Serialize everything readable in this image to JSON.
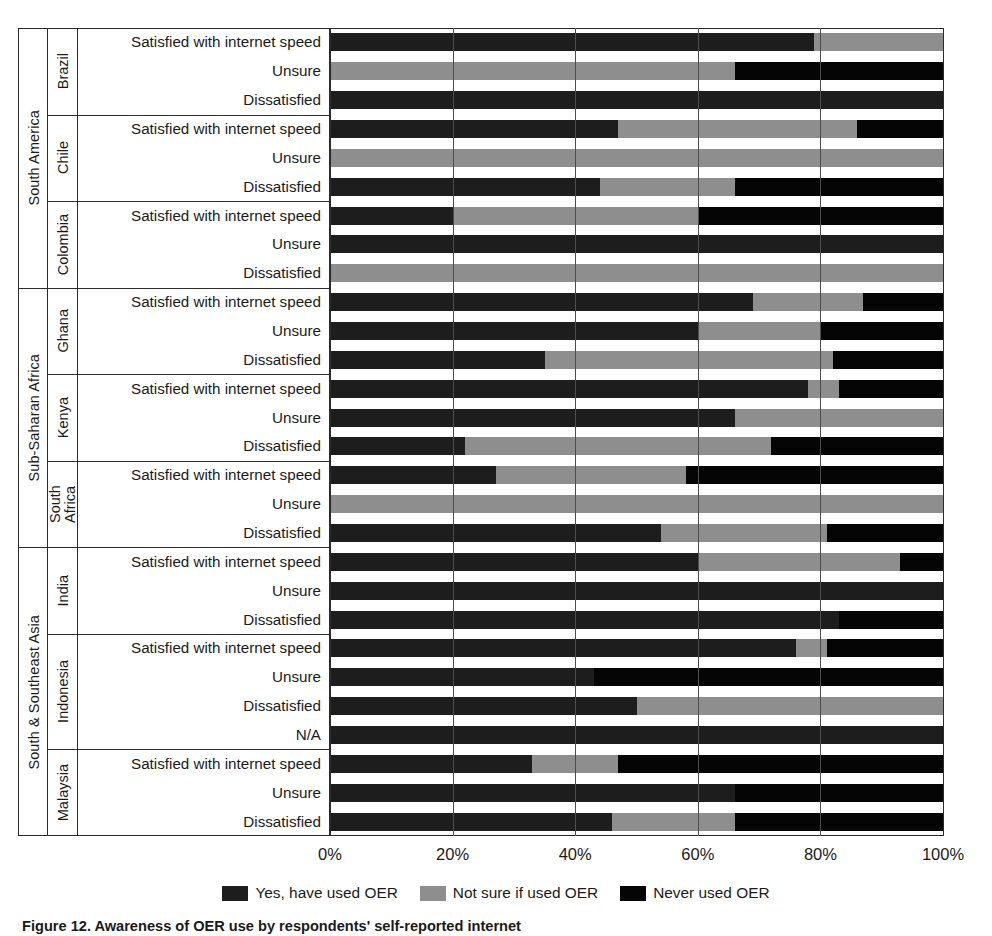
{
  "chart_data": {
    "type": "bar",
    "orientation": "horizontal",
    "stacked": true,
    "normalized": "percent",
    "title": "",
    "xlabel": "",
    "ylabel": "",
    "xlim": [
      0,
      100
    ],
    "xticks": [
      0,
      20,
      40,
      60,
      80,
      100
    ],
    "xtick_labels": [
      "0%",
      "20%",
      "40%",
      "60%",
      "80%",
      "100%"
    ],
    "grid": true,
    "legend_position": "bottom",
    "series": [
      {
        "name": "Yes, have used OER",
        "color": "#1d1d1d"
      },
      {
        "name": "Not sure if used OER",
        "color": "#8e8e8e"
      },
      {
        "name": "Never used OER",
        "color": "#050505"
      }
    ],
    "regions": [
      {
        "label": "South America",
        "countries": [
          {
            "label": "Brazil",
            "rows": [
              {
                "label": "Satisfied with internet speed",
                "values": [
                  79,
                  21,
                  0
                ]
              },
              {
                "label": "Unsure",
                "values": [
                  0,
                  66,
                  34
                ]
              },
              {
                "label": "Dissatisfied",
                "values": [
                  100,
                  0,
                  0
                ]
              }
            ]
          },
          {
            "label": "Chile",
            "rows": [
              {
                "label": "Satisfied with internet speed",
                "values": [
                  47,
                  39,
                  14
                ]
              },
              {
                "label": "Unsure",
                "values": [
                  0,
                  100,
                  0
                ]
              },
              {
                "label": "Dissatisfied",
                "values": [
                  44,
                  22,
                  34
                ]
              }
            ]
          },
          {
            "label": "Colombia",
            "rows": [
              {
                "label": "Satisfied with internet speed",
                "values": [
                  20,
                  40,
                  40
                ]
              },
              {
                "label": "Unsure",
                "values": [
                  100,
                  0,
                  0
                ]
              },
              {
                "label": "Dissatisfied",
                "values": [
                  0,
                  100,
                  0
                ]
              }
            ]
          }
        ]
      },
      {
        "label": "Sub-Saharan Africa",
        "countries": [
          {
            "label": "Ghana",
            "rows": [
              {
                "label": "Satisfied with internet speed",
                "values": [
                  69,
                  18,
                  13
                ]
              },
              {
                "label": "Unsure",
                "values": [
                  60,
                  20,
                  20
                ]
              },
              {
                "label": "Dissatisfied",
                "values": [
                  35,
                  47,
                  18
                ]
              }
            ]
          },
          {
            "label": "Kenya",
            "rows": [
              {
                "label": "Satisfied with internet speed",
                "values": [
                  78,
                  5,
                  17
                ]
              },
              {
                "label": "Unsure",
                "values": [
                  66,
                  34,
                  0
                ]
              },
              {
                "label": "Dissatisfied",
                "values": [
                  22,
                  50,
                  28
                ]
              }
            ]
          },
          {
            "label": "South Africa",
            "label_wrap": true,
            "rows": [
              {
                "label": "Satisfied with internet speed",
                "values": [
                  27,
                  31,
                  42
                ]
              },
              {
                "label": "Unsure",
                "values": [
                  0,
                  100,
                  0
                ]
              },
              {
                "label": "Dissatisfied",
                "values": [
                  54,
                  27,
                  19
                ]
              }
            ]
          }
        ]
      },
      {
        "label": "South & Southeast Asia",
        "countries": [
          {
            "label": "India",
            "rows": [
              {
                "label": "Satisfied with internet speed",
                "values": [
                  60,
                  33,
                  7
                ]
              },
              {
                "label": "Unsure",
                "values": [
                  100,
                  0,
                  0
                ]
              },
              {
                "label": "Dissatisfied",
                "values": [
                  83,
                  0,
                  17
                ]
              }
            ]
          },
          {
            "label": "Indonesia",
            "rows": [
              {
                "label": "Satisfied with internet speed",
                "values": [
                  76,
                  5,
                  19
                ]
              },
              {
                "label": "Unsure",
                "values": [
                  43,
                  0,
                  57
                ]
              },
              {
                "label": "Dissatisfied",
                "values": [
                  50,
                  50,
                  0
                ]
              },
              {
                "label": "N/A",
                "values": [
                  100,
                  0,
                  0
                ]
              }
            ]
          },
          {
            "label": "Malaysia",
            "rows": [
              {
                "label": "Satisfied with internet speed",
                "values": [
                  33,
                  14,
                  53
                ]
              },
              {
                "label": "Unsure",
                "values": [
                  66,
                  0,
                  34
                ]
              },
              {
                "label": "Dissatisfied",
                "values": [
                  46,
                  20,
                  34
                ]
              }
            ]
          }
        ]
      }
    ]
  },
  "legend": {
    "items": [
      {
        "label": "Yes, have used OER",
        "key": "yes"
      },
      {
        "label": "Not sure if used OER",
        "key": "notsure"
      },
      {
        "label": "Never used OER",
        "key": "never"
      }
    ]
  },
  "caption": {
    "text": "Figure 12. Awareness of OER use by respondents' self-reported internet"
  }
}
